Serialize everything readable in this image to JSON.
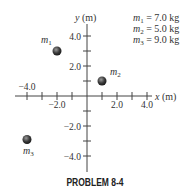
{
  "diagram": {
    "axes": {
      "x_label": "x (m)",
      "y_label": "y (m)",
      "x_ticks": [
        -4,
        -3,
        -2,
        -1,
        1,
        2,
        3,
        4
      ],
      "y_ticks": [
        -4,
        -3,
        -2,
        -1,
        1,
        2,
        3,
        4
      ],
      "x_tick_labels": [
        {
          "value": -4.0,
          "text": "−4.0"
        },
        {
          "value": -2.0,
          "text": "−2.0"
        },
        {
          "value": 2.0,
          "text": "2.0"
        },
        {
          "value": 4.0,
          "text": "4.0"
        }
      ],
      "y_tick_labels": [
        {
          "value": 4.0,
          "text": "4.0"
        },
        {
          "value": 2.0,
          "text": "2.0"
        },
        {
          "value": -2.0,
          "text": "−2.0"
        },
        {
          "value": -4.0,
          "text": "−4.0"
        }
      ]
    },
    "masses": [
      {
        "name": "m",
        "sub": "1",
        "x": -2.0,
        "y": 3.0,
        "value": "7.0 kg"
      },
      {
        "name": "m",
        "sub": "2",
        "x": 1.0,
        "y": 1.0,
        "value": "5.0 kg"
      },
      {
        "name": "m",
        "sub": "3",
        "x": -4.0,
        "y": -2.9,
        "value": "9.0 kg"
      }
    ],
    "legend": [
      {
        "lhs": "m",
        "sub": "1",
        "rhs": " = 7.0 kg"
      },
      {
        "lhs": "m",
        "sub": "2",
        "rhs": " = 5.0 kg"
      },
      {
        "lhs": "m",
        "sub": "3",
        "rhs": " = 9.0 kg"
      }
    ]
  },
  "caption": "PROBLEM 8-4"
}
